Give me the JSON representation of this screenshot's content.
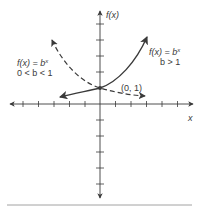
{
  "figure": {
    "axes": {
      "y_label": "f(x)",
      "x_label": "x",
      "origin_px": [
        100,
        104
      ],
      "tick_spacing_px": 15.5,
      "x_ticks_each_side": 6,
      "y_ticks_each_side": 5
    },
    "curves": [
      {
        "name": "growth",
        "style": "solid",
        "label_line1": "f(x) = b",
        "label_exp": "x",
        "label_line2": "b > 1"
      },
      {
        "name": "decay",
        "style": "dashed",
        "label_line1": "f(x) = b",
        "label_exp": "x",
        "label_line2": "0 < b < 1"
      }
    ],
    "point": {
      "label": "(0, 1)",
      "coords": [
        0,
        1
      ]
    },
    "colors": {
      "line": "#3a3a3a",
      "rule": "#8a8a8a"
    }
  }
}
